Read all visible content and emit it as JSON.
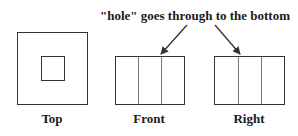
{
  "diagram": {
    "annotation": "\"hole\" goes through to the bottom",
    "views": [
      {
        "id": "top",
        "label": "Top"
      },
      {
        "id": "front",
        "label": "Front"
      },
      {
        "id": "right",
        "label": "Right"
      }
    ],
    "colors": {
      "stroke": "#333333",
      "text": "#1a1a1a",
      "background": "#ffffff"
    }
  }
}
